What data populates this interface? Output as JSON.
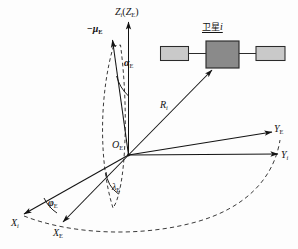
{
  "figure": {
    "type": "coordinate-system-diagram",
    "background_color": "#fdfdfd",
    "line_color": "#131313",
    "satellite": {
      "label_cjk": "卫星",
      "label_index": "i",
      "body_color": "#8a8a8a",
      "panel_color": "#c9c9c9",
      "outline_color": "#2b2b2b"
    },
    "axes": [
      {
        "name": "z-axis",
        "label_main": "Z",
        "label_sub": "i",
        "label_paren_main": "Z",
        "label_paren_sub": "E"
      },
      {
        "name": "y-inertial",
        "label_main": "Y",
        "label_sub": "i"
      },
      {
        "name": "y-earthfixed",
        "label_main": "Y",
        "label_sub": "E"
      },
      {
        "name": "x-inertial",
        "label_main": "X",
        "label_sub": "i"
      },
      {
        "name": "x-earthfixed",
        "label_main": "X",
        "label_sub": "E"
      }
    ],
    "labels": {
      "origin_main": "O",
      "origin_sub": "E",
      "mu_prefix": "−",
      "mu_main": "μ",
      "mu_sub": "E",
      "alpha_main": "α",
      "alpha_sub": "E",
      "lambda_main": "λ",
      "lambda_sub": "E",
      "phi_main": "φ",
      "phi_sub": "E",
      "range_main": "R",
      "range_sub": "i"
    }
  }
}
